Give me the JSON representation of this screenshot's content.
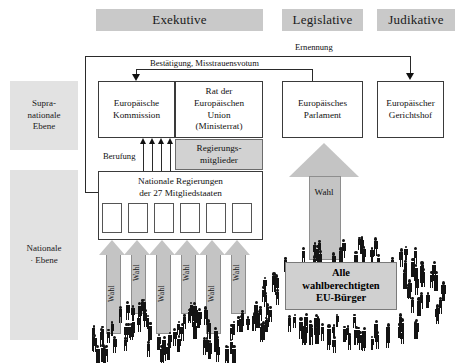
{
  "diagram": {
    "title_banners": [
      {
        "name": "exekutive",
        "label": "Exekutive",
        "x": 96,
        "y": 9,
        "w": 167,
        "h": 22
      },
      {
        "name": "legislative",
        "label": "Legislative",
        "x": 282,
        "y": 9,
        "w": 81,
        "h": 22
      },
      {
        "name": "judikative",
        "label": "Judikative",
        "x": 377,
        "y": 9,
        "w": 78,
        "h": 22
      }
    ],
    "level_banners": [
      {
        "name": "supranational-level",
        "label": "Supra-\nnationale\nEbene",
        "x": 10,
        "y": 81,
        "w": 68,
        "h": 69
      },
      {
        "name": "national-level",
        "label": "Nationale\n· Ebene",
        "x": 10,
        "y": 170,
        "w": 68,
        "h": 170
      }
    ],
    "institution_boxes": [
      {
        "name": "europaeische-kommission",
        "label": "Europäische\nKommission",
        "x": 98,
        "y": 81,
        "w": 77,
        "h": 57
      },
      {
        "name": "rat-der-europaeischen-union",
        "label": "Rat der\nEuropäischen\nUnion\n(Ministerrat)",
        "x": 175,
        "y": 81,
        "w": 88,
        "h": 57
      },
      {
        "name": "europaeisches-parlament",
        "label": "Europäisches\nParlament",
        "x": 282,
        "y": 81,
        "w": 81,
        "h": 57
      },
      {
        "name": "europaeischer-gerichtshof",
        "label": "Europäischer\nGerichtshof",
        "x": 377,
        "y": 81,
        "w": 67,
        "h": 57
      }
    ],
    "government_members_box": {
      "name": "regierungsmitglieder",
      "label": "Regierungs-\nmitglieder",
      "x": 175,
      "y": 139,
      "w": 88,
      "h": 31
    },
    "national_governments_box": {
      "name": "nationale-regierungen",
      "label": "Nationale Regierungen\nder 27 Mitgliedstaaten",
      "x": 98,
      "y": 171,
      "w": 165,
      "h": 69,
      "member_slots": 6
    },
    "connectors": [
      {
        "name": "ernennung-connector",
        "label": "Ernennung"
      },
      {
        "name": "bestaetigung-connector",
        "label": "Bestätigung, Misstrauensvotum"
      },
      {
        "name": "berufung-connector",
        "label": "Berufung"
      }
    ],
    "vote_arrows_national": {
      "name": "wahl-arrows-national",
      "label": "Wahl",
      "count": 6,
      "xs": [
        108,
        133,
        158,
        183,
        208,
        233
      ]
    },
    "vote_arrow_parliament": {
      "name": "wahl-arrow-parliament",
      "label": "Wahl",
      "x": 289,
      "y": 143,
      "w": 70,
      "h": 110
    },
    "citizens_label": {
      "name": "eu-citizens-label",
      "label": "Alle\nwahlberechtigten\nEU-Bürger",
      "x": 285,
      "y": 262,
      "w": 112,
      "h": 48
    },
    "colors": {
      "banner_grey": "#c9c9c9",
      "side_banner_grey": "#e2e2e2",
      "arrow_grey": "#c4c4c4",
      "box_grey": "#d2d2d2",
      "line_black": "#2a2a2a",
      "person_black": "#141414",
      "background": "#ffffff"
    }
  }
}
